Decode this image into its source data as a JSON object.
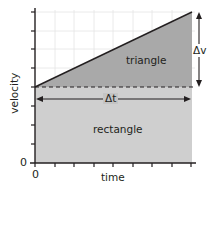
{
  "diagram": {
    "axes": {
      "x_label": "time",
      "y_label": "velocity",
      "x_origin_label": "0",
      "y_origin_label": "0"
    },
    "regions": {
      "triangle_label": "triangle",
      "rectangle_label": "rectangle"
    },
    "annotations": {
      "delta_t": "Δt",
      "delta_v": "Δv"
    },
    "colors": {
      "triangle_fill": "#a9a9a9",
      "rectangle_fill": "#cfcfcf",
      "grid": "#e6e6e6",
      "axis": "#231f20"
    }
  }
}
